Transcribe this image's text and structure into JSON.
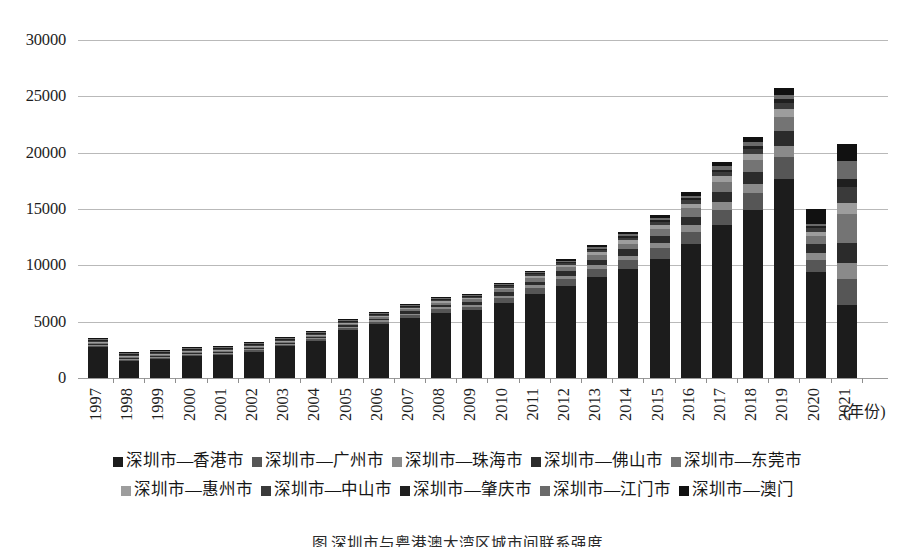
{
  "chart_data": {
    "type": "bar",
    "stacked": true,
    "title": "",
    "subtitle": "",
    "xlabel": "(年份)",
    "ylabel": "",
    "ylim": [
      0,
      30000
    ],
    "ytick_step": 5000,
    "yticks": [
      "30000",
      "25000",
      "20000",
      "15000",
      "10000",
      "5000",
      "0"
    ],
    "grid": true,
    "legend_position": "bottom",
    "categories": [
      "1997",
      "1998",
      "1999",
      "2000",
      "2001",
      "2002",
      "2003",
      "2004",
      "2005",
      "2006",
      "2007",
      "2008",
      "2009",
      "2010",
      "2011",
      "2012",
      "2013",
      "2014",
      "2015",
      "2016",
      "2017",
      "2018",
      "2019",
      "2020",
      "2021"
    ],
    "series": [
      {
        "name": "深圳市—香港市",
        "color": "#1c1c1c",
        "values": [
          2720,
          1510,
          1700,
          1950,
          2080,
          2350,
          2840,
          3280,
          4260,
          4760,
          5320,
          5800,
          6000,
          6700,
          7500,
          8200,
          9000,
          9700,
          10600,
          11900,
          13600,
          14900,
          17700,
          9400,
          6500
        ]
      },
      {
        "name": "深圳市—广州市",
        "color": "#565656",
        "values": [
          80,
          60,
          70,
          80,
          90,
          100,
          120,
          150,
          190,
          230,
          260,
          300,
          330,
          400,
          470,
          560,
          650,
          760,
          900,
          1080,
          1320,
          1520,
          1900,
          1100,
          2300
        ]
      },
      {
        "name": "深圳市—珠海市",
        "color": "#8a8a8a",
        "values": [
          40,
          30,
          35,
          40,
          45,
          55,
          65,
          80,
          100,
          120,
          140,
          160,
          180,
          210,
          250,
          300,
          350,
          410,
          490,
          580,
          700,
          820,
          1000,
          600,
          1400
        ]
      },
      {
        "name": "深圳市—佛山市",
        "color": "#2b2b2b",
        "values": [
          50,
          40,
          45,
          50,
          60,
          70,
          80,
          100,
          130,
          160,
          190,
          220,
          250,
          290,
          340,
          400,
          470,
          550,
          650,
          770,
          930,
          1080,
          1330,
          760,
          1800
        ]
      },
      {
        "name": "深圳市—东莞市",
        "color": "#747474",
        "values": [
          45,
          35,
          40,
          45,
          55,
          65,
          75,
          95,
          120,
          145,
          175,
          205,
          230,
          270,
          320,
          380,
          445,
          520,
          615,
          730,
          880,
          1020,
          1260,
          720,
          2600
        ]
      },
      {
        "name": "深圳市—惠州市",
        "color": "#9d9d9d",
        "values": [
          25,
          20,
          22,
          25,
          30,
          35,
          42,
          52,
          66,
          80,
          95,
          112,
          128,
          150,
          178,
          210,
          248,
          290,
          343,
          407,
          490,
          570,
          700,
          400,
          900
        ]
      },
      {
        "name": "深圳市—中山市",
        "color": "#3a3a3a",
        "values": [
          20,
          15,
          17,
          20,
          24,
          28,
          34,
          42,
          53,
          64,
          76,
          90,
          103,
          120,
          142,
          168,
          198,
          232,
          274,
          326,
          392,
          456,
          560,
          320,
          1500
        ]
      },
      {
        "name": "深圳市—肇庆市",
        "color": "#1f1f1f",
        "values": [
          10,
          8,
          9,
          10,
          12,
          14,
          17,
          21,
          27,
          32,
          38,
          45,
          52,
          60,
          71,
          84,
          99,
          116,
          137,
          163,
          196,
          228,
          280,
          160,
          700
        ]
      },
      {
        "name": "深圳市—江门市",
        "color": "#6a6a6a",
        "values": [
          15,
          12,
          13,
          15,
          18,
          21,
          25,
          31,
          40,
          48,
          57,
          67,
          77,
          90,
          107,
          126,
          149,
          174,
          206,
          244,
          294,
          342,
          420,
          240,
          1600
        ]
      },
      {
        "name": "深圳市—澳门",
        "color": "#111111",
        "values": [
          15,
          10,
          12,
          15,
          16,
          20,
          25,
          30,
          40,
          50,
          60,
          70,
          80,
          95,
          115,
          140,
          168,
          200,
          245,
          300,
          370,
          430,
          560,
          1300,
          1500
        ]
      }
    ]
  },
  "axis": {
    "x_title": "(年份)"
  },
  "legend": {
    "rows": [
      [
        "深圳市—香港市",
        "深圳市—广州市",
        "深圳市—珠海市",
        "深圳市—佛山市",
        "深圳市—东莞市"
      ],
      [
        "深圳市—惠州市",
        "深圳市—中山市",
        "深圳市—肇庆市",
        "深圳市—江门市",
        "深圳市—澳门"
      ]
    ]
  },
  "caption": {
    "text": "图 深圳市与粤港澳大湾区城市间联系强度"
  },
  "colors": {
    "grid": "#b9b9b9",
    "axis_text": "#1d1d1d",
    "background": "#ffffff"
  }
}
